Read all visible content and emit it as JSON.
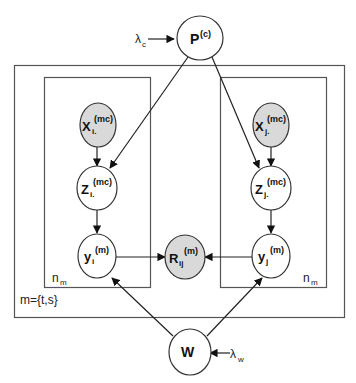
{
  "diagram": {
    "type": "plate-notation graphical model",
    "colors": {
      "line": "#222222",
      "observed_fill": "#d9d9d9",
      "latent_fill": "#ffffff",
      "plate_border": "#555555"
    },
    "nodes": {
      "P": {
        "main": "P",
        "sup": "(c)",
        "sub": "",
        "observed": false
      },
      "Xi": {
        "main": "X",
        "sup": "(mc)",
        "sub": "i.",
        "observed": true
      },
      "Xj": {
        "main": "X",
        "sup": "(mc)",
        "sub": "j.",
        "observed": true
      },
      "Zi": {
        "main": "Z",
        "sup": "(mc)",
        "sub": "i.",
        "observed": false
      },
      "Zj": {
        "main": "Z",
        "sup": "(mc)",
        "sub": "j.",
        "observed": false
      },
      "yi": {
        "main": "y",
        "sup": "(m)",
        "sub": "i",
        "observed": false
      },
      "yj": {
        "main": "y",
        "sup": "(m)",
        "sub": "j",
        "observed": false
      },
      "Rij": {
        "main": "R",
        "sup": "(m)",
        "sub": "ij",
        "observed": true
      },
      "W": {
        "main": "W",
        "sup": "",
        "sub": "",
        "observed": false
      }
    },
    "hyperparameters": {
      "lambda_c": {
        "main": "λ",
        "sub": "c"
      },
      "lambda_w": {
        "main": "λ",
        "sub": "w"
      }
    },
    "plates": {
      "outer": {
        "label": "m={t,s}"
      },
      "inner_left": {
        "label_main": "n",
        "label_sub": "m"
      },
      "inner_right": {
        "label_main": "n",
        "label_sub": "m"
      }
    },
    "edges": [
      [
        "lambda_c",
        "P"
      ],
      [
        "P",
        "Zi"
      ],
      [
        "P",
        "Zj"
      ],
      [
        "Xi",
        "Zi"
      ],
      [
        "Xj",
        "Zj"
      ],
      [
        "Zi",
        "yi"
      ],
      [
        "Zj",
        "yj"
      ],
      [
        "yi",
        "Rij"
      ],
      [
        "yj",
        "Rij"
      ],
      [
        "W",
        "yi"
      ],
      [
        "W",
        "yj"
      ],
      [
        "lambda_w",
        "W"
      ]
    ]
  }
}
